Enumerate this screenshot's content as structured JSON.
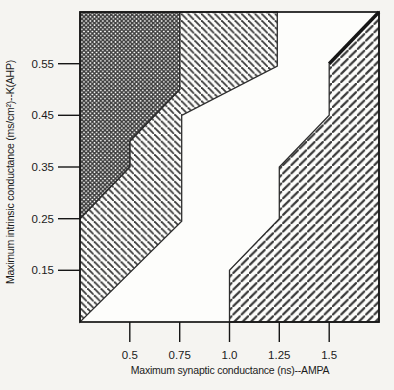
{
  "figure": {
    "background": "#f5f4f1",
    "plot_fill": "#fdfdfb",
    "chart_data": {
      "type": "heatmap",
      "subtype": "phase-region-map",
      "title": "",
      "xlabel": "Maximum synaptic conductance (ns)--AMPA",
      "ylabel": "Maximum intrinsic conductance (ms/cm²)--K(AHP)",
      "xlim": [
        0.25,
        1.75
      ],
      "ylim": [
        0.05,
        0.65
      ],
      "grid": "off",
      "legend": "none",
      "line_color": "#3a3a3a",
      "border_color": "#161616",
      "x_ticks": [
        {
          "value": 0.5,
          "label": "0.5"
        },
        {
          "value": 0.75,
          "label": "0.75"
        },
        {
          "value": 1.0,
          "label": "1.0"
        },
        {
          "value": 1.25,
          "label": "1.25"
        },
        {
          "value": 1.5,
          "label": "1.5"
        }
      ],
      "y_ticks": [
        {
          "value": 0.55,
          "label": "0.55"
        },
        {
          "value": 0.45,
          "label": "0.45"
        },
        {
          "value": 0.35,
          "label": "0.35"
        },
        {
          "value": 0.25,
          "label": "0.25"
        },
        {
          "value": 0.15,
          "label": "0.15"
        }
      ],
      "regions": [
        {
          "name": "upper-left-crosshatch-region",
          "hatch": "cross",
          "points": [
            [
              0.25,
              0.65
            ],
            [
              0.75,
              0.65
            ],
            [
              0.75,
              0.5
            ],
            [
              0.5,
              0.4
            ],
            [
              0.5,
              0.35
            ],
            [
              0.25,
              0.25
            ]
          ]
        },
        {
          "name": "diagonal-band-backslash-region",
          "hatch": "backslash",
          "points": [
            [
              0.75,
              0.65
            ],
            [
              1.24,
              0.65
            ],
            [
              1.24,
              0.545
            ],
            [
              0.76,
              0.45
            ],
            [
              0.76,
              0.245
            ],
            [
              0.25,
              0.05
            ],
            [
              0.25,
              0.25
            ],
            [
              0.5,
              0.35
            ],
            [
              0.5,
              0.4
            ],
            [
              0.75,
              0.5
            ]
          ]
        },
        {
          "name": "lower-right-forwardslash-region",
          "hatch": "forwardslash",
          "points": [
            [
              1.0,
              0.05
            ],
            [
              1.0,
              0.15
            ],
            [
              1.25,
              0.25
            ],
            [
              1.25,
              0.35
            ],
            [
              1.5,
              0.45
            ],
            [
              1.5,
              0.55
            ],
            [
              1.75,
              0.65
            ],
            [
              1.75,
              0.05
            ]
          ]
        }
      ],
      "thick_edge": [
        [
          1.5,
          0.55
        ],
        [
          1.75,
          0.65
        ]
      ]
    }
  }
}
